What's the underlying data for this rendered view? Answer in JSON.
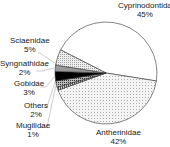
{
  "chart_data": {
    "type": "pie",
    "title": "",
    "categories": [
      "Cyprinodontida",
      "Antherinidae",
      "Mugilidae",
      "Others",
      "Gobidae",
      "Syngnathidae",
      "Sciaenidae"
    ],
    "values": [
      45,
      42,
      1,
      2,
      3,
      2,
      5
    ],
    "unit": "%",
    "fills": [
      "white",
      "light-dots",
      "dense-hatch",
      "dense-dots",
      "black",
      "gray",
      "fine-dots"
    ]
  },
  "labels": {
    "cyprinodontida": {
      "name": "Cyprinodontida",
      "pct": "45%"
    },
    "antherinidae": {
      "name": "Antherinidae",
      "pct": "42%"
    },
    "mugilidae": {
      "name": "Mugilidae",
      "pct": "1%"
    },
    "others": {
      "name": "Others",
      "pct": "2%"
    },
    "gobidae": {
      "name": "Gobidae",
      "pct": "3%"
    },
    "syngnathidae": {
      "name": "Syngnathidae",
      "pct": "2%"
    },
    "sciaenidae": {
      "name": "Sciaenidae",
      "pct": "5%"
    }
  }
}
